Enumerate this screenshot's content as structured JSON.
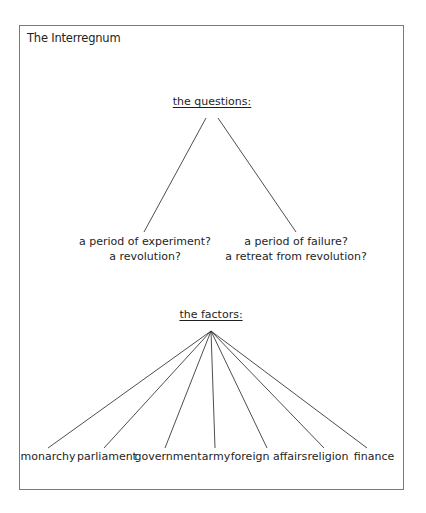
{
  "diagram": {
    "title": "The Interregnum",
    "questions": {
      "heading": "the questions:",
      "branches": [
        {
          "line1": "a period of experiment?",
          "line2": "a revolution?"
        },
        {
          "line1": "a period of failure?",
          "line2": "a retreat from revolution?"
        }
      ]
    },
    "factors": {
      "heading": "the factors:",
      "items": [
        "monarchy",
        "parliament",
        "government",
        "army",
        "foreign affairs",
        "religion",
        "finance"
      ]
    },
    "colors": {
      "border": "#7a7a7a",
      "line": "#3a3a3a",
      "text": "#1e1e1e"
    }
  }
}
